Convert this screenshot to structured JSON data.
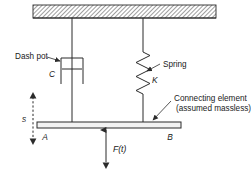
{
  "figure": {
    "labels": {
      "dash_pot": "Dash pot",
      "damping_coefficient": "C",
      "spring": "Spring",
      "spring_constant": "K",
      "connecting_element_line1": "Connecting element",
      "connecting_element_line2": "(assumed massless)",
      "point_a": "A",
      "point_b": "B",
      "displacement": "s",
      "force": "F(t)"
    },
    "colors": {
      "ink": "#2b2b2b",
      "hatch": "#8a8a8a",
      "bar_fill": "#f2f2f2",
      "background": "#ffffff"
    },
    "elements": {
      "ceiling": "fixed-hatched-support",
      "left_branch": "dashpot-damper",
      "right_branch": "coil-spring",
      "bottom_member": "rigid-massless-bar",
      "applied_load": "upward-force-arrow"
    },
    "geometry": {
      "ceiling_x": 33,
      "ceiling_y": 5,
      "ceiling_width": 183,
      "ceiling_height": 13,
      "damper_rod_x": 72,
      "spring_rod_x": 143,
      "bar_y": 123,
      "bar_x_left": 37,
      "bar_x_right": 181,
      "force_arrow_x": 106,
      "spring_coils": 7
    }
  }
}
